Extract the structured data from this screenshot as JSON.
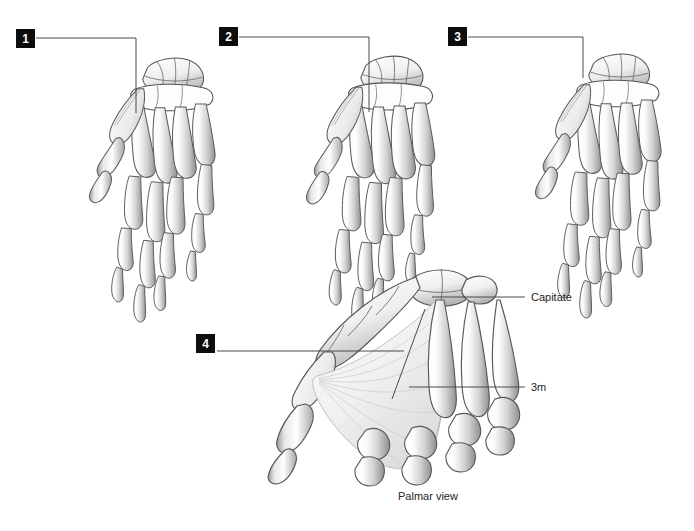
{
  "figure": {
    "background_color": "#ffffff",
    "line_color": "#4a4a4a",
    "callout_bg": "#0d0d0d",
    "callout_fg": "#ffffff",
    "text_color": "#242424",
    "caption": "Palmar view"
  },
  "callouts": [
    {
      "id": "callout-1",
      "label": "1",
      "x": 16,
      "y": 29
    },
    {
      "id": "callout-2",
      "label": "2",
      "x": 219,
      "y": 27
    },
    {
      "id": "callout-3",
      "label": "3",
      "x": 448,
      "y": 27
    },
    {
      "id": "callout-4",
      "label": "4",
      "x": 196,
      "y": 334
    }
  ],
  "annotations": [
    {
      "id": "annotation-capitate",
      "label": "Capitate",
      "x": 531,
      "y": 292
    },
    {
      "id": "annotation-3m",
      "label": "3m",
      "x": 531,
      "y": 382
    }
  ],
  "panels": [
    {
      "id": "panel-1",
      "view": "dorsal",
      "callout": "1"
    },
    {
      "id": "panel-2",
      "view": "dorsal",
      "callout": "2"
    },
    {
      "id": "panel-3",
      "view": "dorsal",
      "callout": "3"
    },
    {
      "id": "panel-4",
      "view": "palmar",
      "callout": "4"
    }
  ]
}
